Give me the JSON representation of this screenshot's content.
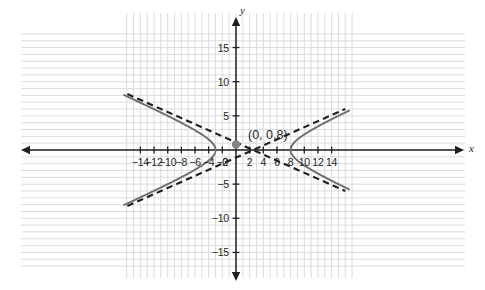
{
  "chart_data": {
    "type": "line",
    "title": "",
    "xlabel": "x",
    "ylabel": "y",
    "xlim": [
      -15.8,
      16.0
    ],
    "ylim": [
      -16.2,
      16.4
    ],
    "grid": true,
    "grid_step": 1,
    "legend": "none",
    "x_ticks": [
      -14,
      -12,
      -10,
      -8,
      -6,
      -4,
      -2,
      2,
      4,
      6,
      8,
      10,
      12,
      14
    ],
    "x_tick_labels": [
      "−14",
      "−12",
      "−10",
      "−8",
      "−6",
      "−4",
      "−2",
      "2",
      "4",
      "6",
      "8",
      "10",
      "12",
      "14"
    ],
    "y_ticks": [
      15,
      10,
      5,
      -5,
      -10,
      -15
    ],
    "y_tick_labels": [
      "15",
      "10",
      "5",
      "−5",
      "−10",
      "−15"
    ],
    "origin_label": "0",
    "curve": {
      "name": "hyperbola",
      "center": [
        2.5,
        0
      ],
      "a": 5.5,
      "b": 2.45,
      "orientation": "horizontal",
      "vertices": [
        [
          -3,
          0
        ],
        [
          8,
          0
        ]
      ],
      "style": "solid",
      "color": "#6d6e71",
      "width": 1.9
    },
    "asymptotes": {
      "name": "asymptotes",
      "slopes": [
        0.445,
        -0.445
      ],
      "through": [
        2.5,
        0
      ],
      "style": "dashed",
      "color": "#231f20",
      "width": 2.1
    },
    "points": [
      {
        "label": "(0, 0.8)",
        "x": 0,
        "y": 0.8,
        "color": "#808285",
        "radius": 4.2
      }
    ]
  },
  "axes": {
    "x_name": "x",
    "y_name": "y",
    "axis_color": "#231f20",
    "grid_color": "#d4d6da"
  }
}
